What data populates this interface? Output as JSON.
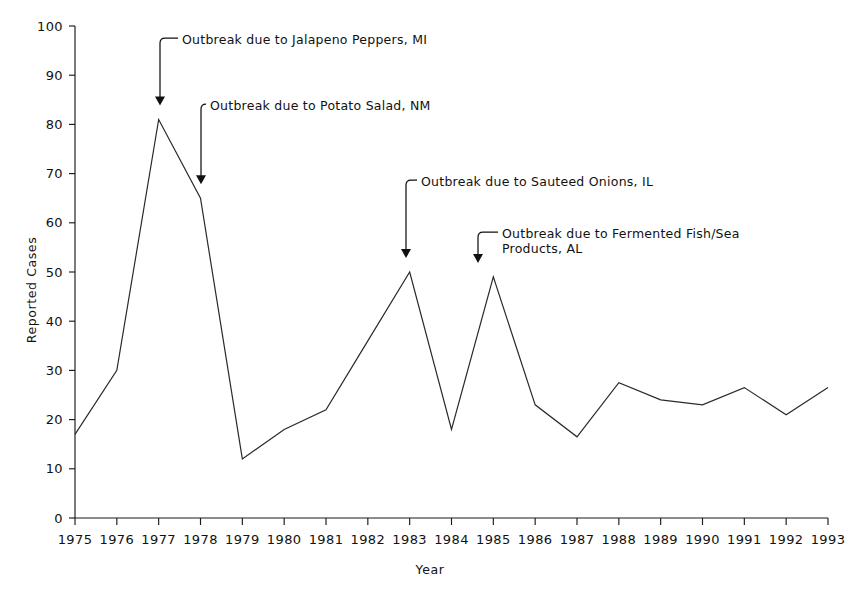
{
  "figure": {
    "background_color": "#ffffff",
    "line_color": "#2a2a2a",
    "text_color": "#111111"
  },
  "axes": {
    "y_title": "Reported Cases",
    "x_title": "Year"
  },
  "chart_data": {
    "type": "line",
    "title": "",
    "subtitle": "",
    "xlabel": "Year",
    "ylabel": "Reported Cases",
    "xlim": [
      1975,
      1993
    ],
    "ylim": [
      0,
      100
    ],
    "grid": false,
    "legend": "none",
    "x": [
      1975,
      1976,
      1977,
      1978,
      1979,
      1980,
      1981,
      1982,
      1983,
      1984,
      1985,
      1986,
      1987,
      1988,
      1989,
      1990,
      1991,
      1992,
      1993
    ],
    "x_tick_labels": [
      "1975",
      "1976",
      "1977",
      "1978",
      "1979",
      "1980",
      "1981",
      "1982",
      "1983",
      "1984",
      "1985",
      "1986",
      "1987",
      "1988",
      "1989",
      "1990",
      "1991",
      "1992",
      "1993"
    ],
    "y_ticks": [
      0,
      10,
      20,
      30,
      40,
      50,
      60,
      70,
      80,
      90,
      100
    ],
    "y_tick_labels": [
      "0",
      "10",
      "20",
      "30",
      "40",
      "50",
      "60",
      "70",
      "80",
      "90",
      "100"
    ],
    "series": [
      {
        "name": "Reported Cases",
        "values": [
          17,
          30,
          81,
          65,
          12,
          18,
          22,
          36,
          50,
          18,
          49,
          23,
          16.5,
          27.5,
          24,
          23,
          26.5,
          21,
          26.5
        ]
      }
    ],
    "annotations": [
      {
        "label": "Outbreak due to Jalapeno Peppers, MI",
        "target_x": 1977,
        "target_y": 81,
        "lines": [
          "Outbreak due to Jalapeno Peppers, MI"
        ]
      },
      {
        "label": "Outbreak due to Potato Salad, NM",
        "target_x": 1978,
        "target_y": 65,
        "lines": [
          "Outbreak due to Potato Salad, NM"
        ]
      },
      {
        "label": "Outbreak due to Sauteed Onions, IL",
        "target_x": 1983,
        "target_y": 50,
        "lines": [
          "Outbreak due to Sauteed Onions, IL"
        ]
      },
      {
        "label": "Outbreak due to Fermented Fish/Sea Products, AL",
        "target_x": 1985,
        "target_y": 49,
        "lines": [
          "Outbreak due to Fermented Fish/Sea",
          "Products, AL"
        ]
      }
    ]
  }
}
